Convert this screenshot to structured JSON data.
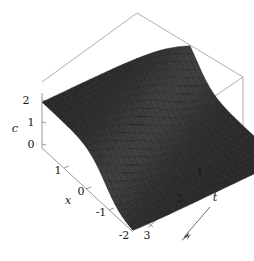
{
  "figure": {
    "background_color": "#ffffff",
    "surface_color": "#4a4a4a",
    "mesh_color": "#171717",
    "box_color": "#8d8d8d"
  },
  "axes": {
    "vertical": {
      "name": "c",
      "label": "c",
      "ticks": [
        "2",
        "1",
        "0"
      ],
      "tick_values": [
        2,
        1,
        0
      ],
      "range": [
        0,
        2.4
      ]
    },
    "depth": {
      "name": "x",
      "label": "x",
      "ticks": [
        "1",
        "0",
        "-1",
        "-2"
      ],
      "tick_values": [
        1,
        0,
        -1,
        -2
      ],
      "range": [
        -2,
        1.6
      ]
    },
    "horizontal": {
      "name": "t",
      "label": "t",
      "ticks": [
        "1",
        "2",
        "3"
      ],
      "tick_values": [
        1,
        2,
        3
      ],
      "range": [
        0,
        3
      ]
    }
  },
  "annotation": {
    "arrow_name": "t-direction-arrow",
    "arrow_label": "t"
  },
  "chart_data": {
    "type": "surface",
    "title": "",
    "xlabel": "x",
    "ylabel": "t",
    "zlabel": "c",
    "xlim": [
      -2,
      1.6
    ],
    "ylim": [
      0,
      3
    ],
    "zlim": [
      0,
      2.4
    ],
    "grid": true,
    "legend": null,
    "x_ticks": [
      1,
      0,
      -1,
      -2
    ],
    "t_ticks": [
      1,
      2,
      3
    ],
    "c_ticks": [
      0,
      1,
      2
    ],
    "mesh_nx": 26,
    "mesh_nt": 26,
    "surface_model": {
      "form": "c(x,t) = 2 / (1 + exp(k*(x_shift)))",
      "amplitude": 2.0,
      "steepness": 3.0,
      "wave_speed": 0.75,
      "front_offset": -0.9
    },
    "sample_profiles": [
      {
        "t": 0.0,
        "x": [
          1.6,
          1.0,
          0.5,
          0.0,
          -0.5,
          -1.0,
          -1.5,
          -2.0
        ],
        "c": [
          1.98,
          1.95,
          1.9,
          1.78,
          1.5,
          1.0,
          0.5,
          0.22
        ]
      },
      {
        "t": 1.0,
        "x": [
          1.6,
          1.0,
          0.5,
          0.0,
          -0.5,
          -1.0,
          -1.5,
          -2.0
        ],
        "c": [
          1.95,
          1.88,
          1.76,
          1.5,
          1.05,
          0.58,
          0.26,
          0.11
        ]
      },
      {
        "t": 2.0,
        "x": [
          1.6,
          1.0,
          0.5,
          0.0,
          -0.5,
          -1.0,
          -1.5,
          -2.0
        ],
        "c": [
          1.88,
          1.72,
          1.45,
          1.02,
          0.58,
          0.26,
          0.11,
          0.04
        ]
      },
      {
        "t": 3.0,
        "x": [
          1.6,
          1.0,
          0.5,
          0.0,
          -0.5,
          -1.0,
          -1.5,
          -2.0
        ],
        "c": [
          1.72,
          1.42,
          1.0,
          0.56,
          0.24,
          0.1,
          0.04,
          0.02
        ]
      }
    ]
  }
}
